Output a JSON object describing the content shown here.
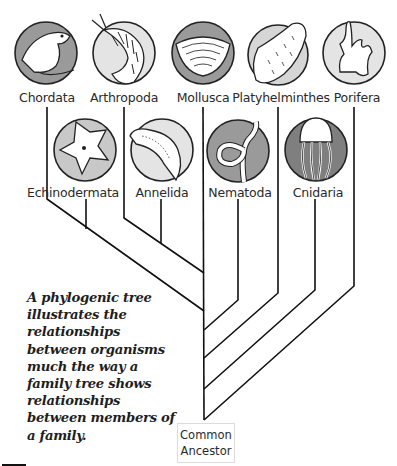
{
  "diagram": {
    "type": "phylogenetic-tree",
    "top_row": [
      {
        "label": "Chordata",
        "icon": "frog-icon"
      },
      {
        "label": "Arthropoda",
        "icon": "shrimp-icon"
      },
      {
        "label": "Mollusca",
        "icon": "clam-shell-icon"
      },
      {
        "label": "Platyhelminthes",
        "icon": "flatworm-icon"
      },
      {
        "label": "Porifera",
        "icon": "sponge-icon"
      }
    ],
    "bottom_row": [
      {
        "label": "Echinodermata",
        "icon": "starfish-icon"
      },
      {
        "label": "Annelida",
        "icon": "segmented-worm-icon"
      },
      {
        "label": "Nematoda",
        "icon": "roundworm-icon"
      },
      {
        "label": "Cnidaria",
        "icon": "jellyfish-icon"
      }
    ],
    "root": {
      "label_line1": "Common",
      "label_line2": "Ancestor"
    },
    "caption": "A phylogenic tree illustrates the relationships between organisms much the way a family tree shows relationships between members of a family.",
    "colors": {
      "line": "#111111",
      "circle_fill": "#d9d9d9",
      "circle_dark": "#8a8a8a",
      "circle_stroke": "#222222"
    }
  }
}
